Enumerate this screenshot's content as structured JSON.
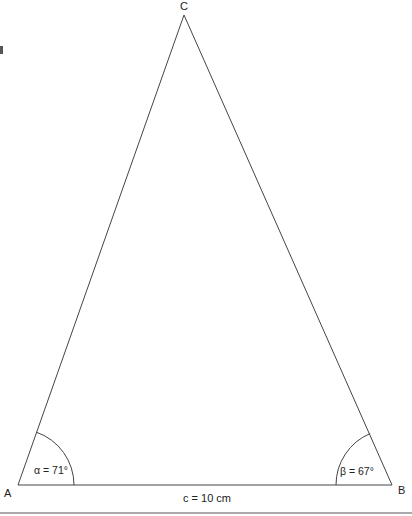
{
  "diagram": {
    "type": "triangle",
    "vertices": {
      "A": {
        "label": "A",
        "x": 18,
        "y": 485
      },
      "B": {
        "label": "B",
        "x": 392,
        "y": 485
      },
      "C": {
        "label": "C",
        "x": 184,
        "y": 15
      }
    },
    "side_c": {
      "label": "c = 10 cm"
    },
    "angle_alpha": {
      "label": "α = 71°"
    },
    "angle_beta": {
      "label": "β = 67°"
    },
    "colors": {
      "line": "#444444",
      "text": "#222222",
      "bottom_rule": "#aaaaaa"
    }
  }
}
